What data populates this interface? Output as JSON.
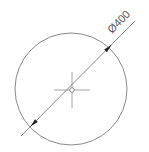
{
  "drawing": {
    "top_text_clipped": "",
    "dimension": {
      "label": "Ø400",
      "type": "diameter",
      "value": 400
    },
    "circle": {
      "cx": 71,
      "cy": 89,
      "r": 56
    },
    "center_mark": {
      "x": 72,
      "y": 90,
      "small_circle_r": 2.5,
      "cross_h_half": 18,
      "cross_v_half": 18
    },
    "leader": {
      "x1": 21,
      "y1": 136,
      "x2": 135,
      "y2": 21
    },
    "colors": {
      "stroke": "#7a7a7a",
      "arrow": "#222222",
      "text": "#555555",
      "background": "#ffffff"
    }
  }
}
